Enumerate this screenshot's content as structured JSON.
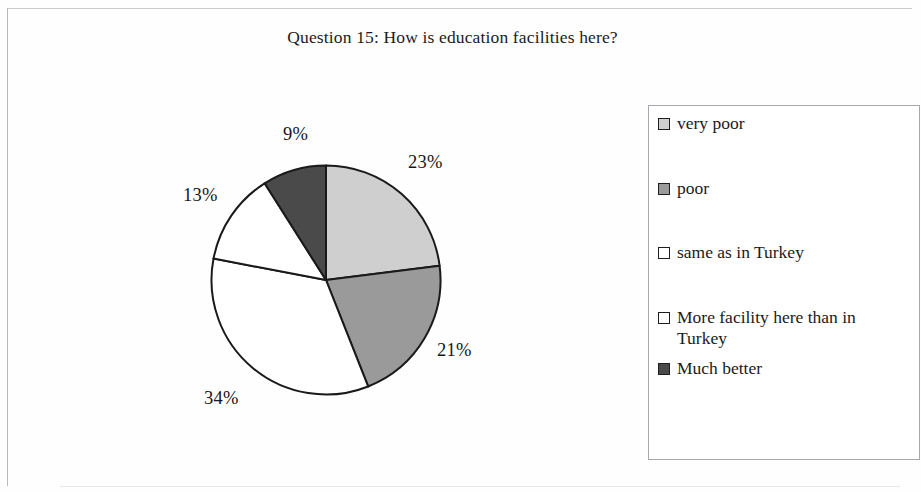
{
  "chart_data": {
    "type": "pie",
    "title": "Question 15: How is education facilities here?",
    "categories": [
      "very poor",
      "poor",
      "same as in Turkey",
      "More facility here than in Turkey",
      "Much better"
    ],
    "values": [
      23,
      21,
      34,
      13,
      9
    ],
    "value_labels": [
      "23%",
      "21%",
      "34%",
      "13%",
      "9%"
    ],
    "slice_colors": [
      "#cfcfcf",
      "#9a9a9a",
      "#ffffff",
      "#ffffff",
      "#4a4a4a"
    ],
    "slice_border_color": "#1a1a1a",
    "start_angle_deg": 0,
    "direction": "clockwise",
    "units": "percent",
    "legend_position": "right",
    "grid": false,
    "xlabel": "",
    "ylabel": ""
  },
  "chart": {
    "title": "Question 15: How is education facilities here?"
  },
  "legend": {
    "items": [
      {
        "label": "very poor",
        "swatch": "#cfcfcf"
      },
      {
        "label": "poor",
        "swatch": "#9a9a9a"
      },
      {
        "label": "same as in Turkey",
        "swatch": "#ffffff"
      },
      {
        "label": "More facility here than in Turkey",
        "swatch": "#ffffff"
      },
      {
        "label": "Much better",
        "swatch": "#4a4a4a"
      }
    ]
  },
  "labels": {
    "values": [
      "23%",
      "21%",
      "34%",
      "13%",
      "9%"
    ]
  }
}
